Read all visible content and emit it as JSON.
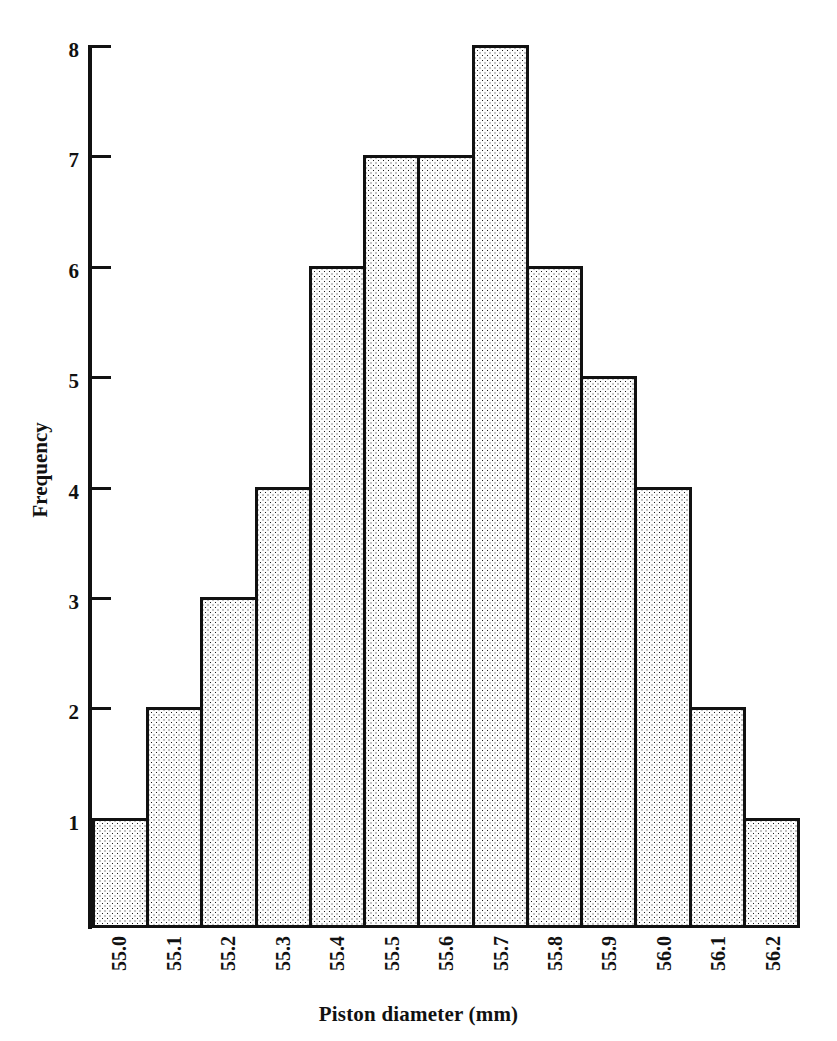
{
  "chart_data": {
    "type": "bar",
    "title": "",
    "subtitle": "",
    "xlabel": "Piston diameter (mm)",
    "ylabel": "Frequency",
    "categories": [
      "55.0",
      "55.1",
      "55.2",
      "55.3",
      "55.4",
      "55.5",
      "55.6",
      "55.7",
      "55.8",
      "55.9",
      "56.0",
      "56.1",
      "56.2"
    ],
    "values": [
      1,
      2,
      3,
      4,
      6,
      7,
      7,
      8,
      6,
      5,
      4,
      2,
      1
    ],
    "xlim": [
      "55.0",
      "56.2"
    ],
    "ylim": [
      0,
      8
    ],
    "y_ticks": [
      1,
      2,
      3,
      4,
      5,
      6,
      7,
      8
    ],
    "y_tick_labels": [
      "1",
      "2",
      "3",
      "4",
      "5",
      "6",
      "7",
      "8"
    ],
    "grid": false,
    "legend": null,
    "legend_position": "none",
    "annotations": [],
    "colors": {
      "bar_fill": "#fcfcfc",
      "bar_stipple": "#1a1a1a",
      "bar_edge": "#111111",
      "axis": "#111111",
      "text": "#111111",
      "background": "#ffffff"
    }
  }
}
